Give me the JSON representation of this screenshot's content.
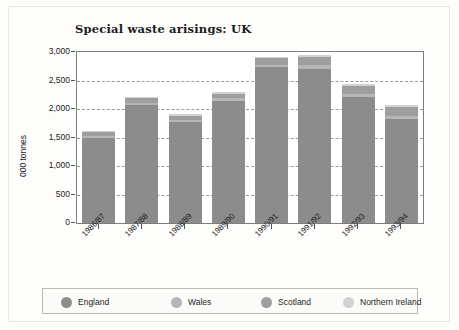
{
  "chart_data": {
    "type": "bar",
    "title": "Special waste arisings: UK",
    "xlabel": "",
    "ylabel": "000 tonnes",
    "ylim": [
      0,
      3000
    ],
    "yticks": [
      "0",
      "500",
      "1,000",
      "1,500",
      "2,000",
      "2,500",
      "3,000"
    ],
    "ytick_values": [
      0,
      500,
      1000,
      1500,
      2000,
      2500,
      3000
    ],
    "grid": "horizontal-dashed",
    "stacked": true,
    "legend_position": "bottom",
    "categories": [
      "1986/87",
      "1987/88",
      "1988/89",
      "1989/90",
      "1990/91",
      "1991/92",
      "1992/93",
      "1993/94"
    ],
    "series": [
      {
        "name": "England",
        "color": "#8c8c8c",
        "values": [
          1500,
          2070,
          1770,
          2140,
          2730,
          2710,
          2210,
          1820
        ]
      },
      {
        "name": "Wales",
        "color": "#b6b6b6",
        "values": [
          30,
          40,
          35,
          45,
          50,
          60,
          60,
          60
        ]
      },
      {
        "name": "Scotland",
        "color": "#9e9e9e",
        "values": [
          60,
          80,
          75,
          85,
          110,
          150,
          140,
          150
        ]
      },
      {
        "name": "Northern Ireland",
        "color": "#d2d2d2",
        "values": [
          30,
          25,
          25,
          25,
          30,
          35,
          35,
          35
        ]
      }
    ],
    "totals": [
      1620,
      2215,
      1905,
      2295,
      2920,
      2955,
      2445,
      2065
    ]
  },
  "legend": {
    "items": [
      {
        "label": "England",
        "color": "#8c8c8c"
      },
      {
        "label": "Wales",
        "color": "#b6b6b6"
      },
      {
        "label": "Scotland",
        "color": "#9e9e9e"
      },
      {
        "label": "Northern Ireland",
        "color": "#d2d2d2"
      }
    ]
  }
}
